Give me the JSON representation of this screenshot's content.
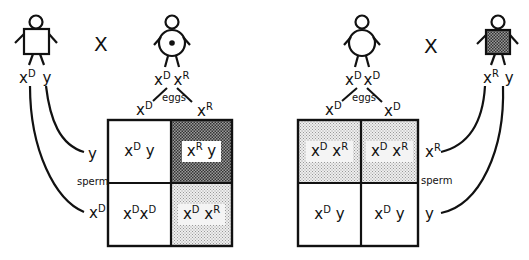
{
  "cross_symbol": "X",
  "left_cross": {
    "father": {
      "shape": "square-unshaded",
      "genotype": [
        "x",
        "D",
        "y"
      ]
    },
    "mother": {
      "shape": "circle-dot-carrier",
      "genotype": [
        "x",
        "D",
        "x",
        "R"
      ]
    },
    "eggs_label": "eggs",
    "sperm_label": "sperm",
    "eggs": [
      {
        "base": "x",
        "sup": "D"
      },
      {
        "base": "x",
        "sup": "R"
      }
    ],
    "sperm": [
      {
        "base": "y",
        "sup": ""
      },
      {
        "base": "x",
        "sup": "D"
      }
    ],
    "cells": [
      {
        "base1": "x",
        "sup1": "D",
        "base2": "y",
        "sup2": "",
        "shade": "none"
      },
      {
        "base1": "x",
        "sup1": "R",
        "base2": "y",
        "sup2": "",
        "shade": "dark"
      },
      {
        "base1": "x",
        "sup1": "D",
        "base2": "x",
        "sup2": "D",
        "shade": "none"
      },
      {
        "base1": "x",
        "sup1": "D",
        "base2": "x",
        "sup2": "R",
        "shade": "light"
      }
    ]
  },
  "right_cross": {
    "mother": {
      "shape": "circle-unshaded",
      "genotype": [
        "x",
        "D",
        "x",
        "D"
      ]
    },
    "father": {
      "shape": "square-shaded-affected",
      "genotype": [
        "x",
        "R",
        "y"
      ]
    },
    "eggs_label": "eggs",
    "sperm_label": "sperm",
    "eggs": [
      {
        "base": "x",
        "sup": "D"
      },
      {
        "base": "x",
        "sup": "D"
      }
    ],
    "sperm": [
      {
        "base": "x",
        "sup": "R"
      },
      {
        "base": "y",
        "sup": ""
      }
    ],
    "cells": [
      {
        "base1": "x",
        "sup1": "D",
        "base2": "x",
        "sup2": "R",
        "shade": "light"
      },
      {
        "base1": "x",
        "sup1": "D",
        "base2": "x",
        "sup2": "R",
        "shade": "light"
      },
      {
        "base1": "x",
        "sup1": "D",
        "base2": "y",
        "sup2": "",
        "shade": "none"
      },
      {
        "base1": "x",
        "sup1": "D",
        "base2": "y",
        "sup2": "",
        "shade": "none"
      }
    ]
  }
}
